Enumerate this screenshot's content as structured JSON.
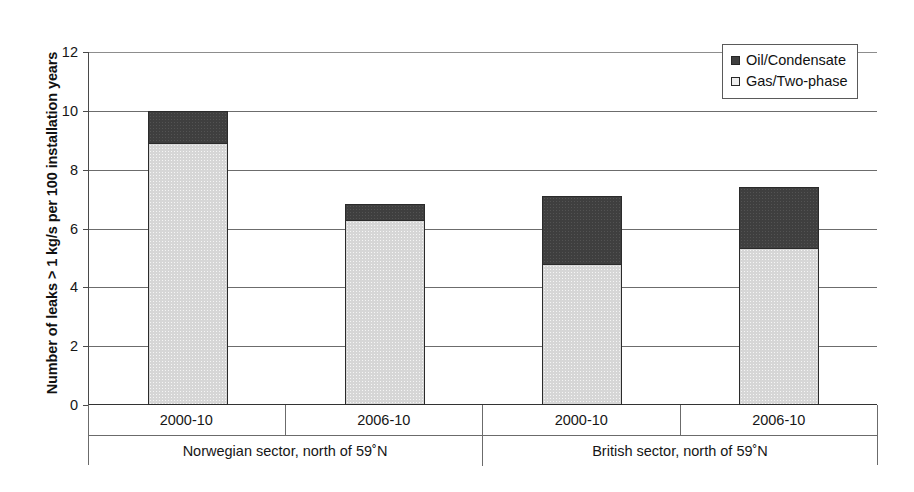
{
  "chart_data": {
    "type": "bar",
    "subtype": "stacked",
    "title": "",
    "xlabel": "",
    "ylabel": "Number of leaks > 1 kg/s per 100 installation years",
    "ylim": [
      0,
      12
    ],
    "yticks": [
      0,
      2,
      4,
      6,
      8,
      10,
      12
    ],
    "ytick_labels": [
      "0",
      "2",
      "4",
      "6",
      "8",
      "10",
      "12"
    ],
    "grid": true,
    "grid_axis": "y",
    "legend_position": "top-right",
    "categories": [
      "2000-10",
      "2006-10",
      "2000-10",
      "2006-10"
    ],
    "groups": [
      {
        "label": "Norwegian sector, north of 59˚N",
        "categories": [
          "2000-10",
          "2006-10"
        ]
      },
      {
        "label": "British sector, north of 59˚N",
        "categories": [
          "2000-10",
          "2006-10"
        ]
      }
    ],
    "series": [
      {
        "name": "Gas/Two-phase",
        "color": "#d6d6d6",
        "values": [
          8.9,
          6.3,
          4.8,
          5.35
        ]
      },
      {
        "name": "Oil/Condensate",
        "color": "#3f3f3f",
        "values": [
          1.1,
          0.55,
          2.3,
          2.05
        ]
      }
    ],
    "totals": [
      10.0,
      6.85,
      7.1,
      7.4
    ]
  },
  "axis": {
    "y_title": "Number of leaks > 1 kg/s per 100 installation years",
    "ticks": [
      {
        "label": "12",
        "value": 12
      },
      {
        "label": "10",
        "value": 10
      },
      {
        "label": "8",
        "value": 8
      },
      {
        "label": "6",
        "value": 6
      },
      {
        "label": "4",
        "value": 4
      },
      {
        "label": "2",
        "value": 2
      },
      {
        "label": "0",
        "value": 0
      }
    ]
  },
  "legend": {
    "entries": [
      {
        "label": "Oil/Condensate",
        "swatch": "dark"
      },
      {
        "label": "Gas/Two-phase",
        "swatch": "light"
      }
    ]
  },
  "categories": [
    {
      "label": "2000-10"
    },
    {
      "label": "2006-10"
    },
    {
      "label": "2000-10"
    },
    {
      "label": "2006-10"
    }
  ],
  "groups": [
    {
      "label": "Norwegian sector, north of 59˚N"
    },
    {
      "label": "British sector, north of 59˚N"
    }
  ],
  "colors": {
    "oil": "#3f3f3f",
    "gas": "#d6d6d6",
    "axis": "#4a4a4a",
    "grid": "#6c6c6c",
    "text": "#161616"
  }
}
